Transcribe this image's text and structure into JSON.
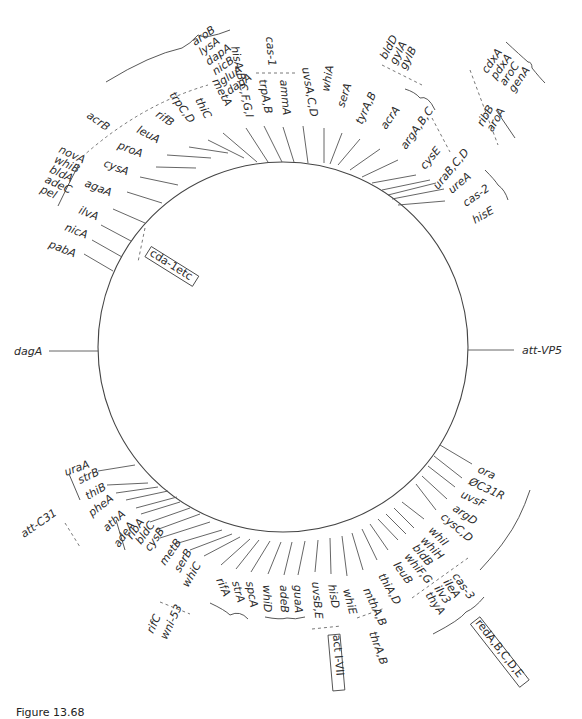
{
  "figure": {
    "caption": "Figure 13.68",
    "circle": {
      "cx": 283,
      "cy": 347,
      "r": 185
    },
    "side_markers": [
      {
        "label": "dagA",
        "x1": 49,
        "y1": 351,
        "x2": 98,
        "y2": 351,
        "lx": 14,
        "ly": 355,
        "rot": 0
      },
      {
        "label": "att-VP5",
        "x1": 468,
        "y1": 350,
        "x2": 514,
        "y2": 350,
        "lx": 522,
        "ly": 354,
        "rot": 0
      }
    ],
    "genes": [
      {
        "label": "pabA",
        "lx": 48,
        "ly": 247,
        "rot": 22,
        "x1": 84,
        "y1": 254,
        "x2": 113,
        "y2": 271
      },
      {
        "label": "nicA",
        "lx": 64,
        "ly": 230,
        "rot": 22,
        "x1": 92,
        "y1": 240,
        "x2": 122,
        "y2": 257
      },
      {
        "label": "ilvA",
        "lx": 78,
        "ly": 213,
        "rot": 22,
        "x1": 101,
        "y1": 225,
        "x2": 131,
        "y2": 241
      },
      {
        "label": "agaA",
        "lx": 84,
        "ly": 186,
        "rot": 22,
        "x1": 113,
        "y1": 209,
        "x2": 145,
        "y2": 223
      },
      {
        "label": "cysA",
        "lx": 103,
        "ly": 166,
        "rot": 22,
        "x1": 127,
        "y1": 192,
        "x2": 162,
        "y2": 203
      },
      {
        "label": "proA",
        "lx": 117,
        "ly": 148,
        "rot": 22,
        "x1": 140,
        "y1": 177,
        "x2": 178,
        "y2": 185
      },
      {
        "label": "leuA",
        "lx": 136,
        "ly": 132,
        "rot": 28,
        "x1": 156,
        "y1": 167,
        "x2": 196,
        "y2": 168
      },
      {
        "label": "rifB",
        "lx": 155,
        "ly": 116,
        "rot": 35,
        "x1": 167,
        "y1": 155,
        "x2": 211,
        "y2": 158
      },
      {
        "label": "trpC,D",
        "lx": 169,
        "ly": 95,
        "rot": 55,
        "x1": 189,
        "y1": 147,
        "x2": 228,
        "y2": 153
      },
      {
        "label": "thiC",
        "lx": 195,
        "ly": 100,
        "rot": 62,
        "x1": 208,
        "y1": 140,
        "x2": 244,
        "y2": 158
      },
      {
        "label": "metA",
        "lx": 212,
        "ly": 81,
        "rot": 62,
        "x1": 223,
        "y1": 133,
        "x2": 257,
        "y2": 162
      },
      {
        "label": "hisA,B,C,F,G,I",
        "lx": 231,
        "ly": 47,
        "rot": 78,
        "x1": 246,
        "y1": 128,
        "x2": 268,
        "y2": 162
      },
      {
        "label": "trpA,B",
        "lx": 259,
        "ly": 80,
        "rot": 80,
        "x1": 264,
        "y1": 126,
        "x2": 282,
        "y2": 162
      },
      {
        "label": "ammA",
        "lx": 280,
        "ly": 80,
        "rot": 85,
        "x1": 283,
        "y1": 127,
        "x2": 294,
        "y2": 162
      },
      {
        "label": "uvsA,C,D",
        "lx": 302,
        "ly": 68,
        "rot": 80,
        "x1": 303,
        "y1": 126,
        "x2": 308,
        "y2": 163
      },
      {
        "label": "whiA",
        "lx": 329,
        "ly": 92,
        "rot": -80,
        "x1": 324,
        "y1": 128,
        "x2": 324,
        "y2": 163
      },
      {
        "label": "serA",
        "lx": 344,
        "ly": 108,
        "rot": -72,
        "x1": 342,
        "y1": 133,
        "x2": 330,
        "y2": 164
      },
      {
        "label": "tyrA,B",
        "lx": 362,
        "ly": 125,
        "rot": -65,
        "x1": 360,
        "y1": 139,
        "x2": 338,
        "y2": 165
      },
      {
        "label": "acrA",
        "lx": 386,
        "ly": 130,
        "rot": -55,
        "x1": 380,
        "y1": 149,
        "x2": 350,
        "y2": 170
      },
      {
        "label": "argA,B,C",
        "lx": 406,
        "ly": 150,
        "rot": -55,
        "x1": 398,
        "y1": 160,
        "x2": 362,
        "y2": 177
      },
      {
        "label": "cysE",
        "lx": 425,
        "ly": 170,
        "rot": -50,
        "x1": 416,
        "y1": 175,
        "x2": 372,
        "y2": 183
      },
      {
        "label": "uraB,C,D",
        "lx": 438,
        "ly": 190,
        "rot": -50,
        "x1": 430,
        "y1": 180,
        "x2": 382,
        "y2": 190
      },
      {
        "label": "ureA",
        "lx": 452,
        "ly": 194,
        "rot": -40,
        "x1": 436,
        "y1": 183,
        "x2": 388,
        "y2": 195
      },
      {
        "label": "cas-2",
        "lx": 466,
        "ly": 207,
        "rot": -35,
        "x1": 444,
        "y1": 189,
        "x2": 392,
        "y2": 199
      },
      {
        "label": "hisE",
        "lx": 475,
        "ly": 224,
        "rot": -30,
        "x1": 445,
        "y1": 201,
        "x2": 398,
        "y2": 205
      },
      {
        "label": "ora",
        "lx": 477,
        "ly": 472,
        "rot": 25,
        "x1": 472,
        "y1": 464,
        "x2": 440,
        "y2": 445
      },
      {
        "label": "ØC31R",
        "lx": 468,
        "ly": 484,
        "rot": 25,
        "x1": 462,
        "y1": 478,
        "x2": 434,
        "y2": 456
      },
      {
        "label": "uvsF",
        "lx": 460,
        "ly": 497,
        "rot": 25,
        "x1": 455,
        "y1": 487,
        "x2": 428,
        "y2": 466
      },
      {
        "label": "argD",
        "lx": 452,
        "ly": 510,
        "rot": 35,
        "x1": 447,
        "y1": 499,
        "x2": 422,
        "y2": 476
      },
      {
        "label": "cysC,D",
        "lx": 440,
        "ly": 518,
        "rot": 40,
        "x1": 436,
        "y1": 510,
        "x2": 416,
        "y2": 484
      },
      {
        "label": "whiI",
        "lx": 428,
        "ly": 531,
        "rot": 45,
        "x1": 424,
        "y1": 519,
        "x2": 402,
        "y2": 502
      },
      {
        "label": "whiH",
        "lx": 420,
        "ly": 541,
        "rot": 45,
        "x1": 414,
        "y1": 528,
        "x2": 394,
        "y2": 508
      },
      {
        "label": "bldB",
        "lx": 412,
        "ly": 548,
        "rot": 50,
        "x1": 406,
        "y1": 534,
        "x2": 386,
        "y2": 514
      },
      {
        "label": "whiF,G",
        "lx": 404,
        "ly": 557,
        "rot": 50,
        "x1": 398,
        "y1": 540,
        "x2": 378,
        "y2": 519
      },
      {
        "label": "leuB",
        "lx": 393,
        "ly": 565,
        "rot": 55,
        "x1": 388,
        "y1": 550,
        "x2": 370,
        "y2": 524
      },
      {
        "label": "thiA,D",
        "lx": 378,
        "ly": 576,
        "rot": 60,
        "x1": 377,
        "y1": 560,
        "x2": 362,
        "y2": 529
      },
      {
        "label": "mthA,B",
        "lx": 363,
        "ly": 590,
        "rot": 65,
        "x1": 363,
        "y1": 570,
        "x2": 352,
        "y2": 533
      },
      {
        "label": "whiE",
        "lx": 343,
        "ly": 590,
        "rot": 75,
        "x1": 347,
        "y1": 576,
        "x2": 342,
        "y2": 536
      },
      {
        "label": "hisD",
        "lx": 328,
        "ly": 585,
        "rot": 80,
        "x1": 331,
        "y1": 574,
        "x2": 330,
        "y2": 538
      },
      {
        "label": "uvsB,E",
        "lx": 312,
        "ly": 582,
        "rot": 85,
        "x1": 315,
        "y1": 572,
        "x2": 318,
        "y2": 540
      },
      {
        "label": "guaA",
        "lx": 294,
        "ly": 585,
        "rot": 88,
        "x1": 298,
        "y1": 575,
        "x2": 305,
        "y2": 541
      },
      {
        "label": "adeB",
        "lx": 280,
        "ly": 585,
        "rot": 88,
        "x1": 284,
        "y1": 575,
        "x2": 292,
        "y2": 542
      },
      {
        "label": "whiD",
        "lx": 263,
        "ly": 585,
        "rot": 88,
        "x1": 268,
        "y1": 574,
        "x2": 281,
        "y2": 542
      },
      {
        "label": "spcA",
        "lx": 246,
        "ly": 582,
        "rot": 80,
        "x1": 251,
        "y1": 572,
        "x2": 270,
        "y2": 541
      },
      {
        "label": "strA",
        "lx": 232,
        "ly": 582,
        "rot": 75,
        "x1": 236,
        "y1": 569,
        "x2": 259,
        "y2": 540
      },
      {
        "label": "rifA",
        "lx": 216,
        "ly": 580,
        "rot": 65,
        "x1": 221,
        "y1": 565,
        "x2": 250,
        "y2": 539
      },
      {
        "label": "whiC",
        "lx": 188,
        "ly": 588,
        "rot": -60,
        "x1": 204,
        "y1": 556,
        "x2": 240,
        "y2": 537
      },
      {
        "label": "serB",
        "lx": 180,
        "ly": 573,
        "rot": -60,
        "x1": 190,
        "y1": 550,
        "x2": 232,
        "y2": 534
      },
      {
        "label": "metB",
        "lx": 165,
        "ly": 566,
        "rot": -55,
        "x1": 175,
        "y1": 544,
        "x2": 222,
        "y2": 530
      },
      {
        "label": "cysB",
        "lx": 150,
        "ly": 552,
        "rot": -55,
        "x1": 160,
        "y1": 538,
        "x2": 210,
        "y2": 522
      },
      {
        "label": "bldC",
        "lx": 141,
        "ly": 545,
        "rot": -55,
        "x1": 156,
        "y1": 530,
        "x2": 200,
        "y2": 514
      },
      {
        "label": "ribA",
        "lx": 132,
        "ly": 540,
        "rot": -55,
        "x1": 150,
        "y1": 522,
        "x2": 190,
        "y2": 508
      },
      {
        "label": "adeA",
        "lx": 119,
        "ly": 548,
        "rot": -55,
        "x1": 141,
        "y1": 514,
        "x2": 180,
        "y2": 502
      },
      {
        "label": "athA",
        "lx": 107,
        "ly": 532,
        "rot": -42,
        "x1": 136,
        "y1": 508,
        "x2": 177,
        "y2": 497
      },
      {
        "label": "pheA",
        "lx": 92,
        "ly": 517,
        "rot": -38,
        "x1": 126,
        "y1": 500,
        "x2": 168,
        "y2": 491
      },
      {
        "label": "thiB",
        "lx": 88,
        "ly": 500,
        "rot": -30,
        "x1": 116,
        "y1": 493,
        "x2": 158,
        "y2": 487
      },
      {
        "label": "strB",
        "lx": 80,
        "ly": 484,
        "rot": -25,
        "x1": 107,
        "y1": 485,
        "x2": 148,
        "y2": 483
      },
      {
        "label": "uraA",
        "lx": 66,
        "ly": 476,
        "rot": -20,
        "x1": 98,
        "y1": 471,
        "x2": 135,
        "y2": 465
      }
    ],
    "groups": [
      {
        "labels": [
          "aroB",
          "lysA",
          "dapA",
          "nicB",
          "gluA",
          "dagA"
        ],
        "lx": 195,
        "ly": 46,
        "rot": -35,
        "dy": 12
      },
      {
        "labels": [
          "novA",
          "whiB",
          "bldA",
          "adeC",
          "pel"
        ],
        "lx": 58,
        "ly": 152,
        "rot": 25,
        "dy": 11
      },
      {
        "labels": [
          "bldD",
          "gylA",
          "gylB"
        ],
        "lx": 386,
        "ly": 60,
        "rot": -62,
        "dy": 11
      },
      {
        "labels": [
          "cdxA",
          "pdxA",
          "aroC",
          "genA"
        ],
        "lx": 487,
        "ly": 74,
        "rot": -55,
        "dy": 11
      },
      {
        "labels": [
          "ribB",
          "aroA"
        ],
        "lx": 483,
        "ly": 127,
        "rot": -60,
        "dy": 11
      },
      {
        "labels": [
          "cas-3",
          "ileA",
          "ilv3",
          "thyA"
        ],
        "lx": 452,
        "ly": 576,
        "rot": 55,
        "dy": 11
      },
      {
        "labels": [
          "rifC",
          "wni-53"
        ],
        "lx": 153,
        "ly": 634,
        "rot": -65,
        "dy": 15
      }
    ],
    "single_labels": [
      {
        "label": "acrB",
        "lx": 86,
        "ly": 117,
        "rot": 35
      },
      {
        "label": "cas-1",
        "lx": 266,
        "ly": 37,
        "rot": 85
      },
      {
        "label": "att-C31",
        "lx": 24,
        "ly": 538,
        "rot": -35
      },
      {
        "label": "thrA,B",
        "lx": 369,
        "ly": 633,
        "rot": 70
      }
    ],
    "boxed_labels": [
      {
        "label": "cda-1etc",
        "lx": 146,
        "ly": 255,
        "rot": 32,
        "w": 56,
        "h": 12
      },
      {
        "label": "act I-VII",
        "lx": 330,
        "ly": 635,
        "rot": 85,
        "w": 56,
        "h": 12
      },
      {
        "label": "redA,B,C,D,E",
        "lx": 472,
        "ly": 623,
        "rot": 52,
        "w": 80,
        "h": 12
      }
    ]
  }
}
